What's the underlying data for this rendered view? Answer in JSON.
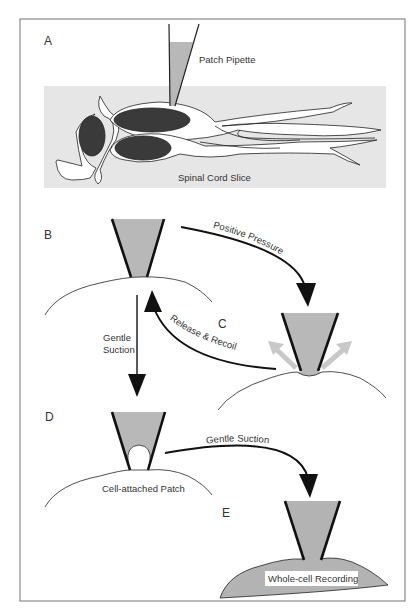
{
  "figure": {
    "colors": {
      "frame": "#8a8a8a",
      "slice_fill": "#e6e6e6",
      "pipette_fill": "#b8b8b8",
      "nucleus": "#3a3a3a",
      "ink": "#111111",
      "release_arrows": "#c8c8c8",
      "whole_cell_fill": "#b3b3b3"
    },
    "panels": {
      "A": {
        "label": "A",
        "pipette_label": "Patch Pipette",
        "slice_label": "Spinal Cord Slice"
      },
      "B": {
        "label": "B"
      },
      "C": {
        "label": "C"
      },
      "D": {
        "label": "D",
        "caption": "Cell-attached Patch"
      },
      "E": {
        "label": "E",
        "caption": "Whole-cell Recording"
      }
    },
    "arrows": {
      "b_to_c": "Positive Pressure",
      "c_to_b": "Release & Recoil",
      "b_to_d_line1": "Gentle",
      "b_to_d_line2": "Suction",
      "d_to_e": "Gentle Suction"
    }
  }
}
